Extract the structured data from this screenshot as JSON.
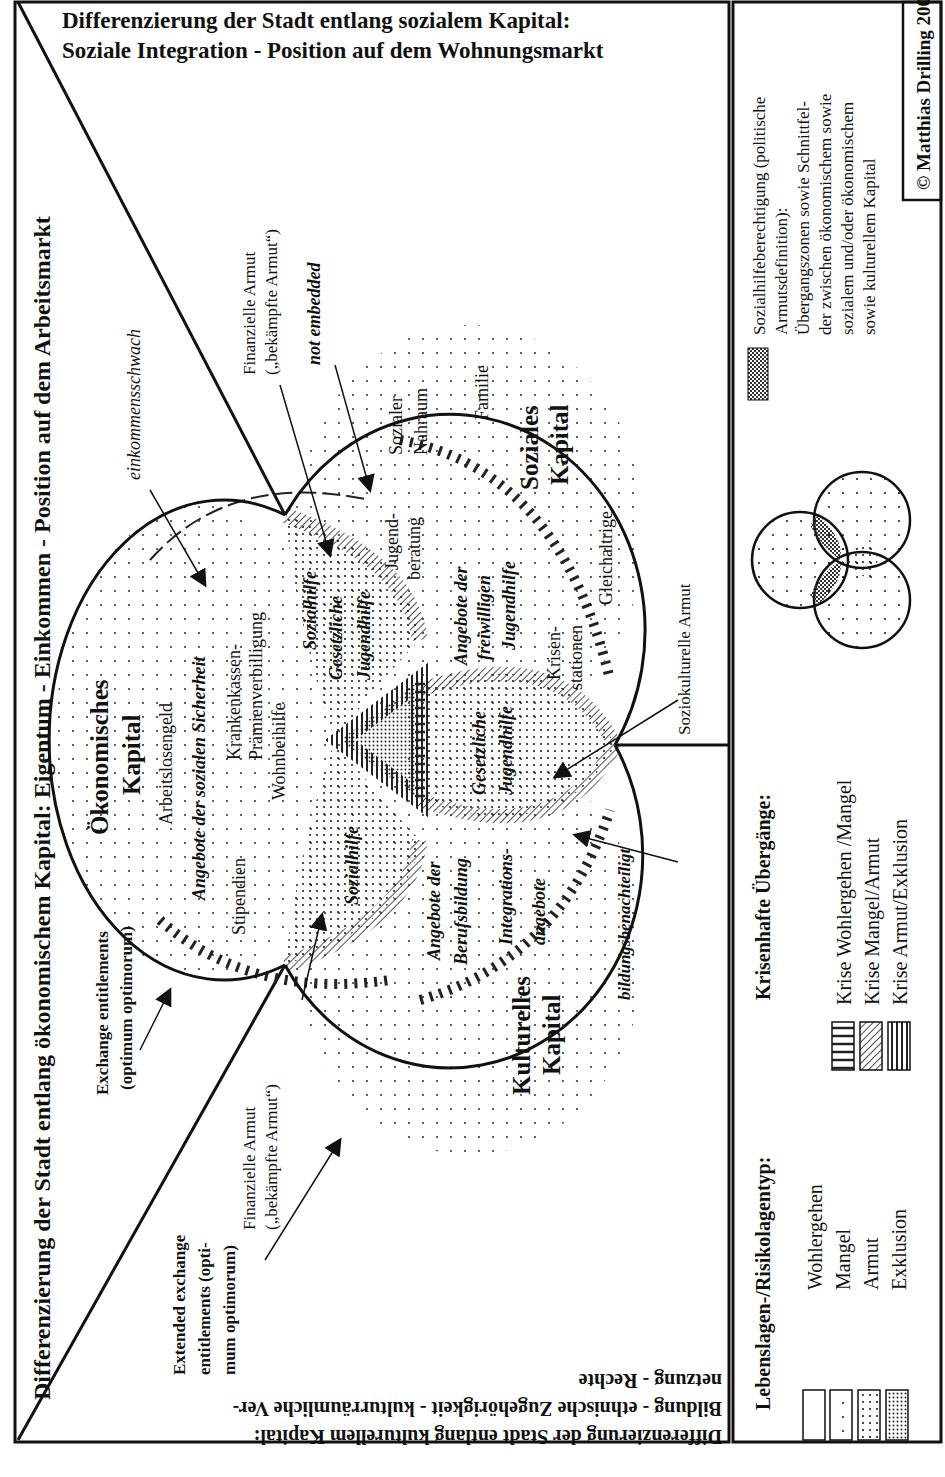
{
  "title": {
    "line1": "Differenzierung der Stadt entlang sozialem Kapital:",
    "line2": "Soziale Integration - Position auf dem Wohnungsmarkt"
  },
  "axes": {
    "economic": "Differenzierung der Stadt entlang ökonomischem Kapital: Eigentum - Einkommen - Position auf dem Arbeitsmarkt",
    "cultural_line1": "Differenzierung der Stadt entlang kulturellem Kapital:",
    "cultural_line2": "Bildung - ethnische Zugehörigkeit - kulturräumliche Ver-",
    "cultural_line3": "netzung - Rechte"
  },
  "circles": {
    "economic": {
      "line1": "Ökonomisches",
      "line2": "Kapital"
    },
    "social": {
      "line1": "Soziales",
      "line2": "Kapital"
    },
    "cultural": {
      "line1": "Kulturelles",
      "line2": "Kapital"
    }
  },
  "economic_items": {
    "arbeitslosengeld": "Arbeitslosengeld",
    "angebote": "Angebote der sozialen Sicherheit",
    "stipendien": "Stipendien",
    "kk1": "Krankenkassen-",
    "kk2": "Prämienverbilligung",
    "wohnbeihilfe": "Wohnbeihilfe"
  },
  "social_items": {
    "sozialer1": "Sozialer",
    "sozialer2": "Nahraum",
    "familie": "Familie",
    "gleichaltrige": "Gleichaltrige",
    "jugend1": "Jugend-",
    "jugend2": "beratung",
    "angebote1": "Angebote der",
    "angebote2": "freiwilligen",
    "angebote3": "Jugendhilfe",
    "krisen1": "Krisen-",
    "krisen2": "stationen"
  },
  "cultural_items": {
    "beruf1": "Angebote der",
    "beruf2": "Berufsbildung",
    "integ1": "Integrations-",
    "integ2": "angebote"
  },
  "intersections": {
    "eco_soc_sozialhilfe": "Sozialhilfe",
    "eco_soc_gj1": "Gesetzliche",
    "eco_soc_gj2": "Jugendhilfe",
    "eco_cul_sozialhilfe": "Sozialhilfe",
    "soc_cul_gj1": "Gesetzliche",
    "soc_cul_gj2": "Jugendhilfe"
  },
  "annotations": {
    "einkommensschwach": "einkommensschwach",
    "not_embedded": "not embedded",
    "fin_armut_top1": "Finanzielle Armut",
    "fin_armut_top2": "(„bekämpfte Armut“)",
    "fin_armut_bottom1": "Finanzielle Armut",
    "fin_armut_bottom2": "(„bekämpfte Armut“)",
    "bildungsbenachteiligt": "bildungsbenachteiligt",
    "soziokulturelle": "Soziokulturelle Armut",
    "exchange1": "Exchange entitlements",
    "exchange2": "(optimum optimorum)",
    "extended1": "Extended exchange",
    "extended2": "entitlements (opti-",
    "extended3": "mum optimorum)"
  },
  "legend": {
    "lebenslagen_title": "Lebenslagen-/Risikolagentyp:",
    "lebenslagen": [
      "Wohlergehen",
      "Mangel",
      "Armut",
      "Exklusion"
    ],
    "krisen_title": "Krisenhafte Übergänge:",
    "krisen": [
      "Krise Wohlergehen /Mangel",
      "Krise Mangel/Armut",
      "Krise Armut/Exklusion"
    ],
    "sozialhilfe_lines": [
      "Sozialhilfeberechtigung (politische",
      "Armutsdefinition):",
      "Übergangszonen sowie Schnittfel-",
      "der zwischen ökonomischem sowie",
      "sozialem und/oder ökonomischem",
      "sowie kulturellem Kapital"
    ],
    "copyright": "© Matthias Drilling 2004"
  }
}
